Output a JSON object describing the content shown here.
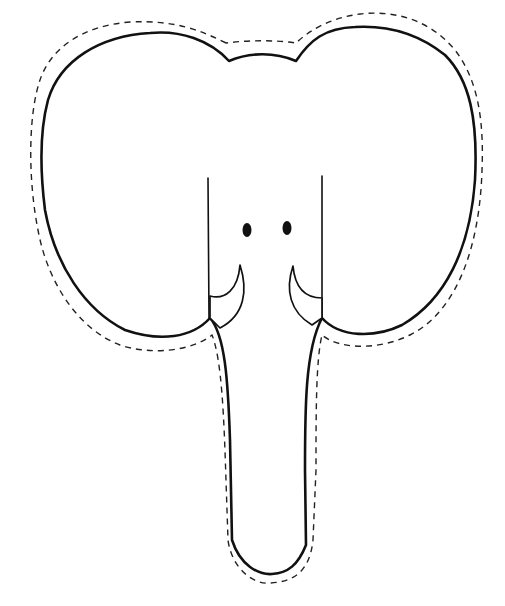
{
  "image": {
    "subject": "elephant head cutout template",
    "background_color": "#ffffff",
    "line_color": "#111111",
    "elements": [
      "head-outline",
      "cut-line-dashed",
      "left-ear",
      "right-ear",
      "trunk",
      "left-eye",
      "right-eye",
      "left-tusk",
      "right-tusk"
    ]
  }
}
